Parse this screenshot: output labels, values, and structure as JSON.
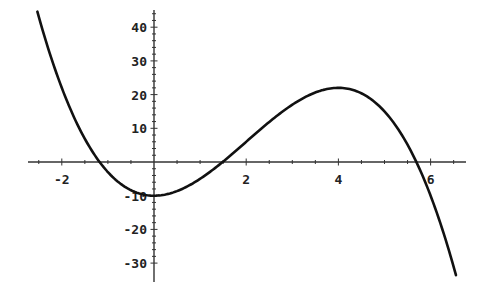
{
  "chart_data": {
    "type": "line",
    "title": "",
    "xlabel": "",
    "ylabel": "",
    "function": "-x^3 + 6x^2 - 10",
    "xlim": [
      -2.53,
      6.55
    ],
    "ylim": [
      -32,
      45
    ],
    "grid": false,
    "legend": null,
    "x_ticks": [
      -2,
      2,
      4,
      6
    ],
    "x_tick_labels": [
      "-2",
      "2",
      "4",
      "6"
    ],
    "y_ticks": [
      40,
      30,
      20,
      10,
      -10,
      -20,
      -30
    ],
    "y_tick_labels": [
      "40",
      "30",
      "20",
      "10",
      "-10",
      "-20",
      "-30"
    ],
    "series": [
      {
        "name": "f(x)",
        "x": [
          -2.5,
          -2.0,
          -1.5,
          -1.0,
          -0.5,
          0.0,
          0.5,
          1.0,
          1.5,
          2.0,
          2.5,
          3.0,
          3.5,
          4.0,
          4.5,
          5.0,
          5.5,
          6.0,
          6.5
        ],
        "y": [
          43.1,
          22.0,
          6.9,
          -3.0,
          -8.4,
          -10.0,
          -8.6,
          -5.0,
          0.1,
          6.0,
          11.9,
          17.0,
          20.6,
          22.0,
          20.4,
          15.0,
          5.1,
          -10.0,
          -31.1
        ]
      }
    ],
    "annotations": {
      "local_min": [
        0,
        -10
      ],
      "local_max": [
        4,
        22
      ],
      "x_intercepts": [
        -1.17,
        1.5,
        5.7
      ]
    }
  },
  "colors": {
    "curve": "#111111",
    "axes": "#333333",
    "background": "#ffffff"
  }
}
